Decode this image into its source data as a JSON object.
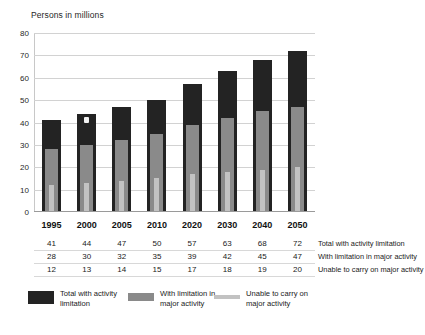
{
  "chart_data": {
    "type": "bar",
    "title": "Persons in millions",
    "xlabel": "",
    "ylabel": "Persons in millions",
    "ylim": [
      0,
      80
    ],
    "yticks": [
      80,
      70,
      60,
      50,
      40,
      30,
      20,
      10,
      0
    ],
    "grid": true,
    "legend_position": "bottom",
    "stacking": "nested-overlay",
    "categories": [
      "1995",
      "2000",
      "2005",
      "2010",
      "2020",
      "2030",
      "2040",
      "2050"
    ],
    "series": [
      {
        "name": "Total with activity limitation",
        "color": "#232323",
        "values": [
          41,
          44,
          47,
          50,
          57,
          63,
          68,
          72
        ]
      },
      {
        "name": "With limitation in major activity",
        "color": "#8a8a8a",
        "values": [
          28,
          30,
          32,
          35,
          39,
          42,
          45,
          47
        ]
      },
      {
        "name": "Unable to carry on major activity",
        "color": "#c2c2c2",
        "values": [
          12,
          13,
          14,
          15,
          17,
          18,
          19,
          20
        ]
      }
    ]
  },
  "table": {
    "rows": [
      {
        "label": "Total with activity limitation",
        "values": [
          "41",
          "44",
          "47",
          "50",
          "57",
          "63",
          "68",
          "72"
        ]
      },
      {
        "label": "With limitation in major activity",
        "values": [
          "28",
          "30",
          "32",
          "35",
          "39",
          "42",
          "45",
          "47"
        ]
      },
      {
        "label": "Unable to carry on major activity",
        "values": [
          "12",
          "13",
          "14",
          "15",
          "17",
          "18",
          "19",
          "20"
        ]
      }
    ]
  },
  "legend": {
    "items": [
      {
        "label": "Total with activity limitation",
        "swatch": "legend-swatch-dark"
      },
      {
        "label": "With limitation in major activity",
        "swatch": "legend-swatch-medium"
      },
      {
        "label": "Unable to carry on major activity",
        "swatch": "legend-swatch-light"
      }
    ]
  }
}
